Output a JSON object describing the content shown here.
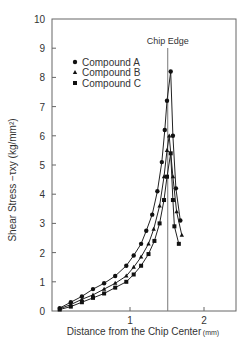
{
  "chart_data": {
    "type": "line",
    "title": "",
    "xlabel": "Distance from the Chip Center",
    "xunit": "(mm)",
    "ylabel": "Shear Stress  −τxy (kg/mm²)",
    "xlim": [
      0,
      2.43
    ],
    "ylim": [
      0,
      10
    ],
    "xticks": [
      "1",
      "2"
    ],
    "yticks": [
      "0",
      "1",
      "2",
      "3",
      "4",
      "5",
      "6",
      "7",
      "8",
      "9",
      "10"
    ],
    "grid": false,
    "legend_position": "upper-left",
    "annotation": {
      "label": "Chip Edge",
      "x": 1.51
    },
    "series": [
      {
        "name": "Compound A",
        "marker": "circle",
        "x": [
          0.05,
          0.2,
          0.35,
          0.5,
          0.65,
          0.8,
          0.95,
          1.05,
          1.15,
          1.22,
          1.3,
          1.37,
          1.43,
          1.47,
          1.5,
          1.55,
          1.58,
          1.62,
          1.68
        ],
        "y": [
          0.1,
          0.3,
          0.5,
          0.75,
          0.95,
          1.2,
          1.55,
          1.9,
          2.3,
          2.75,
          3.3,
          4.1,
          5.1,
          6.2,
          7.2,
          8.2,
          6.0,
          4.2,
          3.1
        ]
      },
      {
        "name": "Compound B",
        "marker": "triangle",
        "x": [
          0.05,
          0.2,
          0.35,
          0.5,
          0.65,
          0.8,
          0.95,
          1.05,
          1.15,
          1.25,
          1.32,
          1.4,
          1.46,
          1.5,
          1.53,
          1.58,
          1.63,
          1.7
        ],
        "y": [
          0.08,
          0.22,
          0.4,
          0.55,
          0.75,
          0.95,
          1.2,
          1.5,
          1.85,
          2.3,
          2.8,
          3.6,
          4.6,
          5.5,
          6.0,
          4.6,
          3.4,
          2.6
        ]
      },
      {
        "name": "Compound C",
        "marker": "square",
        "x": [
          0.05,
          0.2,
          0.35,
          0.5,
          0.65,
          0.8,
          0.95,
          1.05,
          1.15,
          1.25,
          1.33,
          1.4,
          1.46,
          1.5,
          1.55,
          1.58,
          1.6,
          1.66
        ],
        "y": [
          0.05,
          0.15,
          0.3,
          0.45,
          0.6,
          0.8,
          1.0,
          1.25,
          1.55,
          1.95,
          2.4,
          3.0,
          3.8,
          4.6,
          5.4,
          3.8,
          2.9,
          2.3
        ]
      }
    ]
  }
}
